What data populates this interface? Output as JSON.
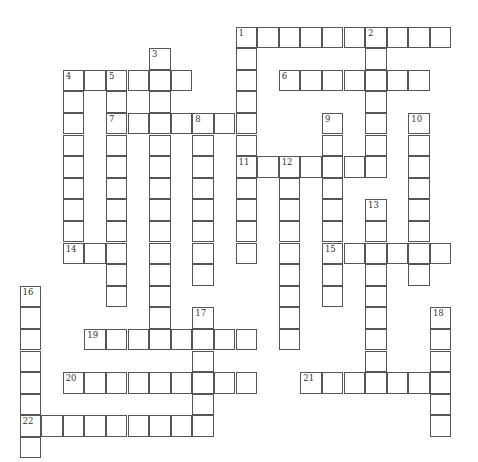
{
  "puzzle": {
    "cell_size": 21.6,
    "origin": {
      "x": 20,
      "y": 27
    },
    "border_color": "#555555",
    "background": "#ffffff",
    "words": [
      {
        "number": "1",
        "direction": "across",
        "row": 0,
        "col": 10,
        "length": 10
      },
      {
        "number": "1",
        "direction": "down",
        "row": 0,
        "col": 10,
        "length": 11
      },
      {
        "number": "2",
        "direction": "down",
        "row": 0,
        "col": 16,
        "length": 7
      },
      {
        "number": "3",
        "direction": "down",
        "row": 1,
        "col": 6,
        "length": 14
      },
      {
        "number": "4",
        "direction": "across",
        "row": 2,
        "col": 2,
        "length": 6
      },
      {
        "number": "4",
        "direction": "down",
        "row": 2,
        "col": 2,
        "length": 9
      },
      {
        "number": "5",
        "direction": "down",
        "row": 2,
        "col": 4,
        "length": 11
      },
      {
        "number": "6",
        "direction": "across",
        "row": 2,
        "col": 12,
        "length": 7
      },
      {
        "number": "7",
        "direction": "across",
        "row": 4,
        "col": 4,
        "length": 7
      },
      {
        "number": "8",
        "direction": "down",
        "row": 4,
        "col": 8,
        "length": 8
      },
      {
        "number": "9",
        "direction": "down",
        "row": 4,
        "col": 14,
        "length": 9
      },
      {
        "number": "10",
        "direction": "down",
        "row": 4,
        "col": 18,
        "length": 8
      },
      {
        "number": "11",
        "direction": "across",
        "row": 6,
        "col": 10,
        "length": 7
      },
      {
        "number": "12",
        "direction": "down",
        "row": 6,
        "col": 12,
        "length": 9
      },
      {
        "number": "13",
        "direction": "down",
        "row": 8,
        "col": 16,
        "length": 9
      },
      {
        "number": "14",
        "direction": "across",
        "row": 10,
        "col": 2,
        "length": 3
      },
      {
        "number": "15",
        "direction": "across",
        "row": 10,
        "col": 14,
        "length": 6
      },
      {
        "number": "16",
        "direction": "down",
        "row": 12,
        "col": 0,
        "length": 8
      },
      {
        "number": "17",
        "direction": "down",
        "row": 13,
        "col": 8,
        "length": 6
      },
      {
        "number": "18",
        "direction": "down",
        "row": 13,
        "col": 19,
        "length": 6
      },
      {
        "number": "19",
        "direction": "across",
        "row": 14,
        "col": 3,
        "length": 8
      },
      {
        "number": "20",
        "direction": "across",
        "row": 16,
        "col": 2,
        "length": 9
      },
      {
        "number": "21",
        "direction": "across",
        "row": 16,
        "col": 13,
        "length": 7
      },
      {
        "number": "22",
        "direction": "across",
        "row": 18,
        "col": 0,
        "length": 9
      }
    ]
  }
}
